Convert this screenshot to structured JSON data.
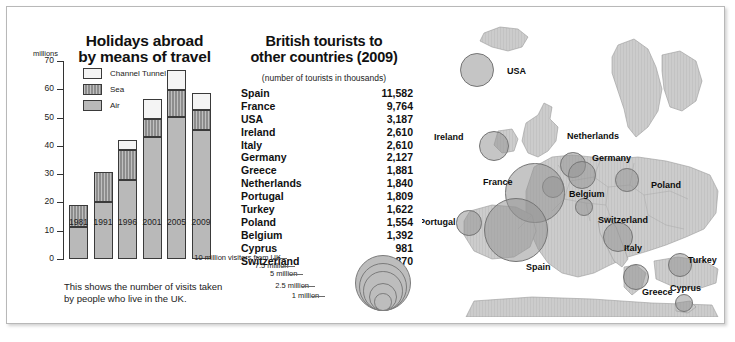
{
  "chart_data": [
    {
      "type": "bar",
      "title": "Holidays abroad by means of travel",
      "title_line1": "Holidays abroad",
      "title_line2": "by means of travel",
      "ylabel": "millions",
      "xlabel": "",
      "ylim": [
        0,
        70
      ],
      "yticks": [
        0,
        10,
        20,
        30,
        40,
        50,
        60,
        70
      ],
      "categories": [
        "1981",
        "1991",
        "1996",
        "2001",
        "2005",
        "2009"
      ],
      "stacked": true,
      "grid": false,
      "legend_position": "inside-top-left",
      "series": [
        {
          "name": "Air",
          "values": [
            11.4,
            20.3,
            27.8,
            43.0,
            50.2,
            45.7
          ]
        },
        {
          "name": "Sea",
          "values": [
            7.6,
            10.6,
            10.7,
            6.5,
            9.5,
            7.1
          ]
        },
        {
          "name": "Channel Tunnel",
          "values": [
            0.0,
            0.0,
            3.6,
            7.1,
            7.2,
            5.8
          ]
        }
      ],
      "totals": [
        19.0,
        30.9,
        42.1,
        56.6,
        66.9,
        58.6
      ],
      "caption": "This shows the number of visits taken by people who live in the UK."
    },
    {
      "type": "table",
      "title_line1": "British tourists to",
      "title_line2": "other countries (2009)",
      "subtitle": "(number of tourists in thousands)",
      "columns": [
        "Country",
        "Tourists"
      ],
      "categories": [
        "Spain",
        "France",
        "USA",
        "Ireland",
        "Italy",
        "Germany",
        "Greece",
        "Netherlands",
        "Portugal",
        "Turkey",
        "Poland",
        "Belgium",
        "Cyprus",
        "Switzerland"
      ],
      "values": [
        11582,
        9764,
        3187,
        2610,
        2610,
        2127,
        1881,
        1840,
        1809,
        1622,
        1554,
        1392,
        981,
        870
      ],
      "rows": [
        {
          "country": "Spain",
          "value": "11,582"
        },
        {
          "country": "France",
          "value": "9,764"
        },
        {
          "country": "USA",
          "value": "3,187"
        },
        {
          "country": "Ireland",
          "value": "2,610"
        },
        {
          "country": "Italy",
          "value": "2,610"
        },
        {
          "country": "Germany",
          "value": "2,127"
        },
        {
          "country": "Greece",
          "value": "1,881"
        },
        {
          "country": "Netherlands",
          "value": "1,840"
        },
        {
          "country": "Portugal",
          "value": "1,809"
        },
        {
          "country": "Turkey",
          "value": "1,622"
        },
        {
          "country": "Poland",
          "value": "1,554"
        },
        {
          "country": "Belgium",
          "value": "1,392"
        },
        {
          "country": "Cyprus",
          "value": "981"
        },
        {
          "country": "Switzerland",
          "value": "870"
        }
      ]
    },
    {
      "type": "scatter",
      "subtype": "proportional-symbol-map",
      "title": "",
      "region": "Europe and North Atlantic",
      "size_unit": "million visitors from UK",
      "size_key": [
        {
          "label": "10 million visitors from UK",
          "value": 10
        },
        {
          "label": "7.5 million",
          "value": 7.5
        },
        {
          "label": "5 million",
          "value": 5
        },
        {
          "label": "2.5 million",
          "value": 2.5
        },
        {
          "label": "1 million",
          "value": 1
        }
      ],
      "points": [
        {
          "label": "USA",
          "value": 3.187,
          "x": 55,
          "y": 55
        },
        {
          "label": "Ireland",
          "value": 2.61,
          "x": 72,
          "y": 131
        },
        {
          "label": "Netherlands",
          "value": 1.84,
          "x": 151,
          "y": 150
        },
        {
          "label": "Germany",
          "value": 2.127,
          "x": 160,
          "y": 160
        },
        {
          "label": "Belgium",
          "value": 1.392,
          "x": 131,
          "y": 172
        },
        {
          "label": "Poland",
          "value": 1.554,
          "x": 205,
          "y": 165
        },
        {
          "label": "France",
          "value": 9.764,
          "x": 113,
          "y": 178
        },
        {
          "label": "Switzerland",
          "value": 0.87,
          "x": 162,
          "y": 192
        },
        {
          "label": "Portugal",
          "value": 1.809,
          "x": 47,
          "y": 208
        },
        {
          "label": "Spain",
          "value": 11.582,
          "x": 94,
          "y": 215
        },
        {
          "label": "Italy",
          "value": 2.61,
          "x": 196,
          "y": 222
        },
        {
          "label": "Turkey",
          "value": 1.622,
          "x": 258,
          "y": 250
        },
        {
          "label": "Greece",
          "value": 1.881,
          "x": 214,
          "y": 262
        },
        {
          "label": "Cyprus",
          "value": 0.981,
          "x": 262,
          "y": 288
        }
      ]
    }
  ],
  "chart": {
    "title_line1": "Holidays abroad",
    "title_line2": "by means of travel",
    "units": "millions",
    "caption": "This shows the number of visits taken by people who live in the UK.",
    "legend": [
      {
        "label": "Channel Tunnel",
        "swatch": "tunnel"
      },
      {
        "label": "Sea",
        "swatch": "sea"
      },
      {
        "label": "Air",
        "swatch": "air"
      }
    ]
  },
  "table": {
    "title_line1": "British tourists to",
    "title_line2": "other countries (2009)",
    "subtitle": "(number of tourists in thousands)"
  },
  "colors": {
    "air": "#b9b9b9",
    "sea": "#8d8d8d",
    "tunnel": "#f4f4f4",
    "bubble": "#969696",
    "land": "#c9c9c9",
    "sea_bg": "#ffffff",
    "text": "#111111",
    "border": "#3a3a3a"
  }
}
